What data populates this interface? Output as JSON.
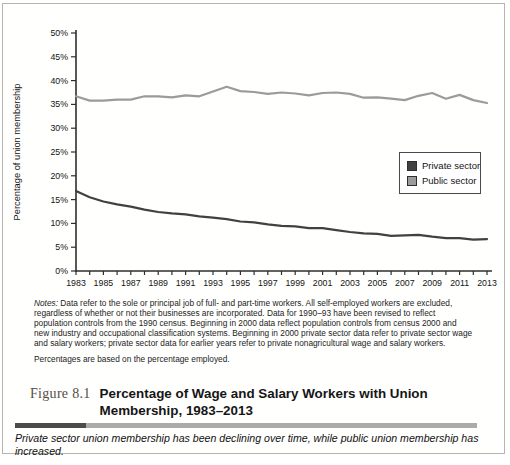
{
  "figure": {
    "label": "Figure 8.1",
    "title": "Percentage of Wage and Salary Workers with Union Membership, 1983–2013",
    "notes_label": "Notes:",
    "notes_body": " Data refer to the sole or principal job of full- and part-time workers. All self-employed workers are excluded, regardless of whether or not their businesses are incorporated. Data for 1990–93 have been revised to reflect population controls from the 1990 census. Beginning in 2000 data reflect population controls from census 2000 and new industry and occupational classification systems. Beginning in 2000 private sector data refer to private sector wage and salary workers; private sector data for earlier years refer to private nonagricultural wage and salary workers.",
    "notes_line2": "Percentages are based on the percentage employed.",
    "summary": "Private sector union membership has been declining over time, while public union membership has increased."
  },
  "chart_data": {
    "type": "line",
    "title": "",
    "xlabel": "",
    "ylabel": "Percentage of union membership",
    "ylim": [
      0,
      50
    ],
    "ytick_step": 5,
    "ytick_suffix": "%",
    "xtick_label_step": 2,
    "grid": false,
    "legend_position": "right-middle",
    "x": [
      1983,
      1984,
      1985,
      1986,
      1987,
      1988,
      1989,
      1990,
      1991,
      1992,
      1993,
      1994,
      1995,
      1996,
      1997,
      1998,
      1999,
      2000,
      2001,
      2002,
      2003,
      2004,
      2005,
      2006,
      2007,
      2008,
      2009,
      2010,
      2011,
      2012,
      2013
    ],
    "series": [
      {
        "name": "Private sector",
        "color": "#414141",
        "values": [
          16.8,
          15.5,
          14.6,
          14.0,
          13.5,
          12.9,
          12.4,
          12.1,
          11.9,
          11.5,
          11.2,
          10.9,
          10.4,
          10.2,
          9.8,
          9.5,
          9.4,
          9.0,
          9.0,
          8.6,
          8.2,
          7.9,
          7.8,
          7.4,
          7.5,
          7.6,
          7.2,
          6.9,
          6.9,
          6.6,
          6.7
        ]
      },
      {
        "name": "Public sector",
        "color": "#9b9b9b",
        "values": [
          36.7,
          35.8,
          35.8,
          36.0,
          36.0,
          36.7,
          36.7,
          36.5,
          36.9,
          36.7,
          37.7,
          38.7,
          37.8,
          37.6,
          37.2,
          37.5,
          37.3,
          36.9,
          37.4,
          37.5,
          37.2,
          36.4,
          36.5,
          36.2,
          35.9,
          36.8,
          37.4,
          36.2,
          37.0,
          35.9,
          35.3
        ]
      }
    ]
  },
  "colors": {
    "axis": "#2e2e2e",
    "tick_label": "#141414",
    "box_border": "#b6b6ae",
    "divider_dark": "#4c4c4c",
    "divider_light": "#ababab",
    "figure_label": "#564c44"
  }
}
